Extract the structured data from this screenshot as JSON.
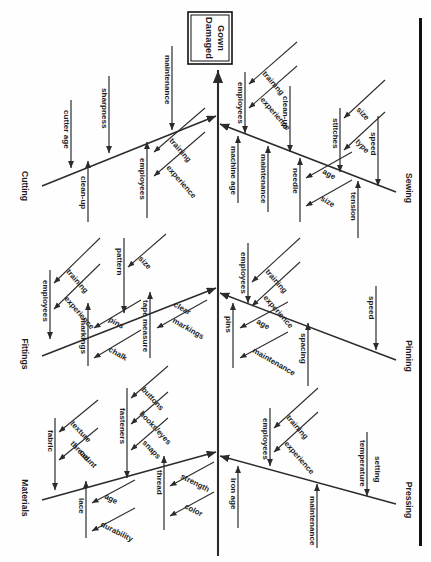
{
  "diagram": {
    "type": "fishbone-ishikawa",
    "orientation": "rotated-90-clockwise",
    "effect_box": {
      "line1": "Damaged",
      "line2": "Gown"
    },
    "categories": [
      {
        "name": "Cutting",
        "side": "left",
        "causes": [
          {
            "label": "cutter age",
            "subcauses": []
          },
          {
            "label": "sharpness",
            "subcauses": []
          },
          {
            "label": "maintenance",
            "subcauses": []
          },
          {
            "label": "clean-up",
            "subcauses": []
          },
          {
            "label": "employees",
            "subcauses": [
              "training",
              "experience"
            ]
          }
        ]
      },
      {
        "name": "Sewing",
        "side": "right",
        "causes": [
          {
            "label": "employees",
            "subcauses": [
              "training",
              "experience"
            ]
          },
          {
            "label": "machine age",
            "subcauses": []
          },
          {
            "label": "maintenance",
            "subcauses": []
          },
          {
            "label": "clean-up",
            "subcauses": []
          },
          {
            "label": "needle",
            "subcauses": [
              "age",
              "size"
            ]
          },
          {
            "label": "stitches",
            "subcauses": [
              "size",
              "type"
            ]
          },
          {
            "label": "speed",
            "subcauses": []
          },
          {
            "label": "tension",
            "subcauses": []
          }
        ]
      },
      {
        "name": "Fittings",
        "side": "left",
        "causes": [
          {
            "label": "employees",
            "subcauses": [
              "training",
              "experience"
            ]
          },
          {
            "label": "pattern",
            "subcauses": [
              "size"
            ]
          },
          {
            "label": "markings",
            "subcauses": [
              "pins",
              "chalk"
            ]
          },
          {
            "label": "tape measure",
            "subcauses": [
              "clear markings"
            ]
          }
        ]
      },
      {
        "name": "Pinning",
        "side": "right",
        "causes": [
          {
            "label": "employees",
            "subcauses": [
              "training",
              "experience"
            ]
          },
          {
            "label": "pins",
            "subcauses": [
              "age",
              "maintenance"
            ]
          },
          {
            "label": "spacing",
            "subcauses": []
          },
          {
            "label": "speed",
            "subcauses": []
          }
        ]
      },
      {
        "name": "Materials",
        "side": "left",
        "causes": [
          {
            "label": "fabric",
            "subcauses": [
              "texture",
              "thread count"
            ]
          },
          {
            "label": "lace",
            "subcauses": [
              "age",
              "durability"
            ]
          },
          {
            "label": "fasteners",
            "subcauses": [
              "buttons",
              "hooks/eyes",
              "snaps"
            ]
          },
          {
            "label": "thread",
            "subcauses": [
              "strength",
              "color"
            ]
          }
        ]
      },
      {
        "name": "Pressing",
        "side": "right",
        "causes": [
          {
            "label": "employees",
            "subcauses": [
              "training",
              "experience"
            ]
          },
          {
            "label": "iron age",
            "subcauses": []
          },
          {
            "label": "maintenance",
            "subcauses": []
          },
          {
            "label": "temperature setting",
            "subcauses": []
          }
        ]
      }
    ],
    "labels": {
      "cutting": "Cutting",
      "sewing": "Sewing",
      "fittings": "Fittings",
      "pinning": "Pinning",
      "materials": "Materials",
      "pressing": "Pressing",
      "cutter_age": "cutter age",
      "sharpness": "sharpness",
      "maintenance": "maintenance",
      "clean_up": "clean-up",
      "employees": "employees",
      "training": "training",
      "experience": "experience",
      "machine_age": "machine age",
      "needle": "needle",
      "age": "age",
      "size": "size",
      "stitches": "stitches",
      "type": "type",
      "speed": "speed",
      "tension": "tension",
      "pattern": "pattern",
      "markings": "markings",
      "pins": "pins",
      "chalk": "chalk",
      "tape_measure": "tape measure",
      "clear": "clear",
      "spacing": "spacing",
      "fabric": "fabric",
      "texture": "texture",
      "thread": "thread",
      "count": "count",
      "lace": "lace",
      "durability": "durability",
      "fasteners": "fasteners",
      "buttons": "buttons",
      "hooks_eyes": "hooks/eyes",
      "snaps": "snaps",
      "strength": "strength",
      "color": "color",
      "iron_age": "iron age",
      "temperature": "temperature",
      "setting": "setting"
    },
    "colors": {
      "ink": "#1d1d1d",
      "line": "#2b2b2b",
      "background": "#ffffff",
      "frame": "#111111"
    }
  }
}
